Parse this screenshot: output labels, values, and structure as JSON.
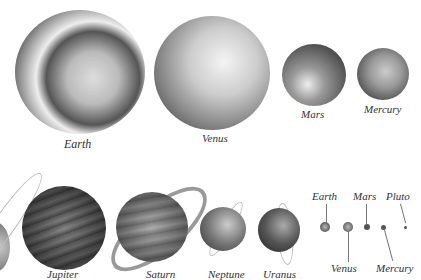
{
  "illustration": {
    "subject": "Planets of the solar system, relative sizes",
    "top_row": [
      {
        "name": "Earth"
      },
      {
        "name": "Venus"
      },
      {
        "name": "Mars"
      },
      {
        "name": "Mercury"
      }
    ],
    "bottom_row": [
      {
        "name": "Jupiter"
      },
      {
        "name": "Saturn"
      },
      {
        "name": "Neptune"
      },
      {
        "name": "Uranus"
      }
    ],
    "scale_comparison": [
      {
        "name": "Earth"
      },
      {
        "name": "Mars"
      },
      {
        "name": "Pluto"
      },
      {
        "name": "Venus"
      },
      {
        "name": "Mercury"
      }
    ]
  }
}
